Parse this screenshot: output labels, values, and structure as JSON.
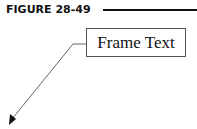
{
  "figure": {
    "label": "FIGURE 28-49"
  },
  "diagram": {
    "frame_text": "Frame Text",
    "leader": {
      "start": [
        86,
        44
      ],
      "elbow": [
        73,
        44
      ],
      "arrow_tip": [
        9,
        124
      ]
    }
  }
}
